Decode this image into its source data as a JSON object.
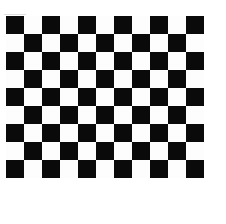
{
  "figure": {
    "name": "checkerboard-calibration-target",
    "background_color": "#ffffff",
    "canvas": {
      "width": 226,
      "height": 224
    }
  },
  "chart_data": {
    "type": "heatmap",
    "subtitle": "",
    "xlabel": "",
    "ylabel": "",
    "columns": 11,
    "rows": 9,
    "cell_size_px": 18,
    "origin_x_px": 6,
    "origin_y_px": 16,
    "board_width_px": 198,
    "board_height_px": 162,
    "colors": {
      "dark": "#0a0a0a",
      "light": "#fdfdfd"
    },
    "legend": {
      "show": false,
      "position": "none"
    },
    "grid": false,
    "axis_visible": false,
    "xticklabels": [],
    "yticklabels": [],
    "values": [
      [
        1,
        0,
        1,
        0,
        1,
        0,
        1,
        0,
        1,
        0,
        1
      ],
      [
        0,
        1,
        0,
        1,
        0,
        1,
        0,
        1,
        0,
        1,
        0
      ],
      [
        1,
        0,
        1,
        0,
        1,
        0,
        1,
        0,
        1,
        0,
        1
      ],
      [
        0,
        1,
        0,
        1,
        0,
        1,
        0,
        1,
        0,
        1,
        0
      ],
      [
        1,
        0,
        1,
        0,
        1,
        0,
        1,
        0,
        1,
        0,
        1
      ],
      [
        0,
        1,
        0,
        1,
        0,
        1,
        0,
        1,
        0,
        1,
        0
      ],
      [
        1,
        0,
        1,
        0,
        1,
        0,
        1,
        0,
        1,
        0,
        1
      ],
      [
        0,
        1,
        0,
        1,
        0,
        1,
        0,
        1,
        0,
        1,
        0
      ],
      [
        1,
        0,
        1,
        0,
        1,
        0,
        1,
        0,
        1,
        0,
        1
      ]
    ]
  },
  "caption": {
    "text": "",
    "visible_fragment": "",
    "clipped": true
  }
}
